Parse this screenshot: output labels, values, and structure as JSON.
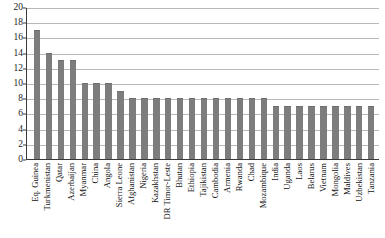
{
  "chart_data": {
    "type": "bar",
    "title": "",
    "subtitle": "",
    "xlabel": "",
    "ylabel": "",
    "ylim": [
      0,
      20
    ],
    "ytick_step": 2,
    "ytick_labels": [
      "20",
      "18",
      "16",
      "14",
      "12",
      "10",
      "8",
      "6",
      "4",
      "2",
      "0"
    ],
    "yticks": [
      20,
      18,
      16,
      14,
      12,
      10,
      8,
      6,
      4,
      2,
      0
    ],
    "grid": true,
    "grid_axis": "y",
    "legend": null,
    "legend_position": "none",
    "bar_color": "#7d7d7d",
    "axis_color": "#3a3a3a",
    "grid_color": "#b9b9b9",
    "categories": [
      "Eq. Guinea",
      "Turkmenistan",
      "Qatar",
      "Azerbaijan",
      "Myanmar",
      "China",
      "Angola",
      "Sierra Leone",
      "Afghanistan",
      "Nigeria",
      "Kazakhstan",
      "DR Timor-Leste",
      "Bhutan",
      "Ethiopia",
      "Tajikistan",
      "Cambodia",
      "Armenia",
      "Rwanda",
      "Chad",
      "Mozambique",
      "India",
      "Uganda",
      "Laos",
      "Belarus",
      "Vietnam",
      "Mongolia",
      "Maldives",
      "Uzbekistan",
      "Tanzania"
    ],
    "values": [
      17,
      14,
      13,
      13,
      10,
      10,
      10,
      9,
      8,
      8,
      8,
      8,
      8,
      8,
      8,
      8,
      8,
      8,
      8,
      8,
      7,
      7,
      7,
      7,
      7,
      7,
      7,
      7,
      7
    ]
  }
}
